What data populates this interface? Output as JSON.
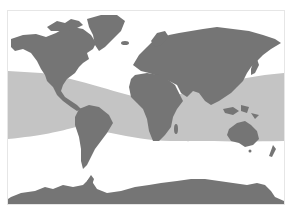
{
  "map": {
    "type": "world-map",
    "projection": "equirectangular-like",
    "colors": {
      "background": "#ffffff",
      "land": "#757575",
      "highlight_band": "#c4c4c4",
      "frame": "#e6e6e6"
    },
    "highlight_band": {
      "description": "shaded tropical/subtropical zone spanning oceans between roughly 30N and 30S"
    },
    "regions": [
      "north-america",
      "greenland",
      "south-america",
      "europe",
      "africa",
      "asia",
      "australia",
      "new-zealand",
      "antarctica"
    ]
  }
}
